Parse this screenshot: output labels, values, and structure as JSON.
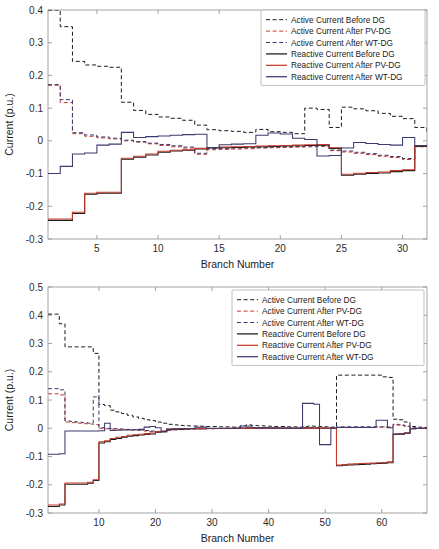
{
  "figure": {
    "title": "",
    "background": "#ffffff"
  },
  "colors": {
    "black": "#1a1a1a",
    "red": "#c0392b",
    "navy": "#3b3b6e",
    "axis": "#9a9a9a",
    "text": "#1a1a1a",
    "legend_border": "#b0b0b0"
  },
  "legend": {
    "position": "top-right",
    "items": [
      {
        "label": "Active Current Before DG",
        "color_key": "black",
        "style": "dashed"
      },
      {
        "label": "Active Current After PV-DG",
        "color_key": "red",
        "style": "dashed"
      },
      {
        "label": "Active Current After WT-DG",
        "color_key": "navy",
        "style": "dashed"
      },
      {
        "label": "Reactive Current Before DG",
        "color_key": "black",
        "style": "solid"
      },
      {
        "label": "Reactive Current After PV-DG",
        "color_key": "red",
        "style": "solid"
      },
      {
        "label": "Reactive Current After WT-DG",
        "color_key": "navy",
        "style": "solid"
      }
    ]
  },
  "chart_data": [
    {
      "id": "top",
      "type": "line",
      "title": "",
      "xlabel": "Branch Number",
      "ylabel": "Current (p.u.)",
      "xlim": [
        1,
        32
      ],
      "ylim": [
        -0.3,
        0.4
      ],
      "xticks": [
        5,
        10,
        15,
        20,
        25,
        30
      ],
      "yticks": [
        -0.3,
        -0.2,
        -0.1,
        0,
        0.1,
        0.2,
        0.3,
        0.4
      ],
      "ytick_labels": [
        "-0.3",
        "-0.2",
        "-0.1",
        "0",
        "0.1",
        "0.2",
        "0.3",
        "0.4"
      ],
      "grid": false,
      "step": "post",
      "x": [
        1,
        2,
        3,
        4,
        5,
        6,
        7,
        8,
        9,
        10,
        11,
        12,
        13,
        14,
        15,
        16,
        17,
        18,
        19,
        20,
        21,
        22,
        23,
        24,
        25,
        26,
        27,
        28,
        29,
        30,
        31,
        32
      ],
      "series": [
        {
          "name": "Active Current Before DG",
          "color_key": "black",
          "style": "dashed",
          "values": [
            0.4,
            0.349,
            0.243,
            0.232,
            0.228,
            0.225,
            0.118,
            0.093,
            0.081,
            0.073,
            0.069,
            0.063,
            0.048,
            0.034,
            0.031,
            0.029,
            0.026,
            0.035,
            0.028,
            0.026,
            0.022,
            0.1,
            0.096,
            0.041,
            0.103,
            0.098,
            0.092,
            0.084,
            0.075,
            0.068,
            0.041,
            0.025
          ]
        },
        {
          "name": "Active Current After PV-DG",
          "color_key": "red",
          "style": "dashed",
          "values": [
            0.17,
            0.117,
            0.022,
            0.014,
            0.009,
            0.006,
            0.0,
            -0.004,
            -0.009,
            -0.014,
            -0.018,
            -0.022,
            -0.041,
            -0.027,
            -0.026,
            -0.025,
            -0.024,
            -0.022,
            -0.021,
            -0.02,
            -0.019,
            -0.018,
            -0.017,
            -0.03,
            -0.034,
            -0.038,
            -0.042,
            -0.047,
            -0.051,
            -0.057,
            -0.018,
            -0.014
          ]
        },
        {
          "name": "Active Current After WT-DG",
          "color_key": "navy",
          "style": "dashed",
          "values": [
            0.172,
            0.126,
            0.025,
            0.018,
            0.012,
            0.008,
            0.002,
            -0.002,
            -0.007,
            -0.011,
            -0.015,
            -0.019,
            -0.038,
            -0.024,
            -0.023,
            -0.022,
            -0.021,
            -0.02,
            -0.019,
            -0.018,
            -0.017,
            -0.016,
            -0.015,
            -0.028,
            -0.031,
            -0.035,
            -0.039,
            -0.044,
            -0.048,
            -0.054,
            -0.016,
            -0.012
          ]
        },
        {
          "name": "Reactive Current Before DG",
          "color_key": "black",
          "style": "solid",
          "values": [
            -0.243,
            -0.243,
            -0.222,
            -0.163,
            -0.16,
            -0.16,
            -0.056,
            -0.05,
            -0.043,
            -0.035,
            -0.031,
            -0.029,
            -0.025,
            -0.022,
            -0.021,
            -0.02,
            -0.019,
            -0.018,
            -0.017,
            -0.016,
            -0.015,
            -0.014,
            -0.013,
            -0.023,
            -0.105,
            -0.102,
            -0.1,
            -0.098,
            -0.094,
            -0.091,
            -0.017,
            -0.014
          ]
        },
        {
          "name": "Reactive Current After PV-DG",
          "color_key": "red",
          "style": "solid",
          "values": [
            -0.239,
            -0.239,
            -0.218,
            -0.16,
            -0.157,
            -0.157,
            -0.053,
            -0.047,
            -0.04,
            -0.032,
            -0.029,
            -0.027,
            -0.023,
            -0.02,
            -0.019,
            -0.018,
            -0.017,
            -0.016,
            -0.015,
            -0.014,
            -0.013,
            -0.012,
            -0.011,
            -0.021,
            -0.102,
            -0.099,
            -0.097,
            -0.095,
            -0.091,
            -0.088,
            -0.015,
            -0.012
          ]
        },
        {
          "name": "Reactive Current After WT-DG",
          "color_key": "navy",
          "style": "solid",
          "values": [
            -0.1,
            -0.078,
            -0.04,
            -0.037,
            -0.013,
            -0.01,
            0.026,
            0.01,
            0.013,
            0.015,
            0.017,
            0.019,
            0.02,
            -0.02,
            -0.012,
            -0.01,
            -0.009,
            0.017,
            0.024,
            0.021,
            0.008,
            0.004,
            -0.046,
            -0.045,
            -0.022,
            -0.005,
            -0.008,
            -0.011,
            -0.013,
            0.01,
            -0.014,
            -0.014
          ]
        }
      ]
    },
    {
      "id": "bottom",
      "type": "line",
      "title": "",
      "xlabel": "Branch Number",
      "ylabel": "Current (p.u.)",
      "xlim": [
        1,
        68
      ],
      "ylim": [
        -0.3,
        0.5
      ],
      "xticks": [
        10,
        20,
        30,
        40,
        50,
        60
      ],
      "yticks": [
        -0.3,
        -0.2,
        -0.1,
        0,
        0.1,
        0.2,
        0.3,
        0.4,
        0.5
      ],
      "ytick_labels": [
        "-0.3",
        "-0.2",
        "-0.1",
        "0",
        "0.1",
        "0.2",
        "0.3",
        "0.4",
        "0.5"
      ],
      "grid": false,
      "step": "post",
      "x": [
        1,
        2,
        3,
        4,
        5,
        6,
        7,
        8,
        9,
        10,
        11,
        12,
        13,
        14,
        15,
        16,
        17,
        18,
        19,
        20,
        21,
        22,
        23,
        24,
        25,
        26,
        27,
        28,
        29,
        30,
        31,
        32,
        33,
        34,
        35,
        36,
        37,
        38,
        39,
        40,
        41,
        42,
        43,
        44,
        45,
        46,
        47,
        48,
        49,
        50,
        51,
        52,
        53,
        54,
        55,
        56,
        57,
        58,
        59,
        60,
        61,
        62,
        63,
        64,
        65,
        66,
        67,
        68
      ],
      "series": [
        {
          "name": "Active Current Before DG",
          "color_key": "black",
          "style": "dashed",
          "values": [
            0.404,
            0.404,
            0.37,
            0.288,
            0.288,
            0.288,
            0.288,
            0.288,
            0.265,
            0.084,
            0.08,
            0.064,
            0.058,
            0.052,
            0.046,
            0.04,
            0.035,
            0.03,
            0.027,
            0.022,
            0.018,
            0.014,
            0.012,
            0.01,
            0.009,
            0.008,
            0.008,
            0.007,
            0.006,
            0.006,
            0.005,
            0.005,
            0.004,
            0.004,
            0.008,
            0.012,
            0.01,
            0.009,
            0.008,
            0.007,
            0.006,
            0.006,
            0.005,
            0.005,
            0.004,
            0.006,
            0.008,
            0.007,
            0.006,
            0.005,
            0.004,
            0.188,
            0.188,
            0.188,
            0.188,
            0.188,
            0.188,
            0.188,
            0.188,
            0.182,
            0.18,
            0.032,
            0.03,
            0.022,
            0.006,
            0.004,
            0.003,
            0.002
          ]
        },
        {
          "name": "Active Current After PV-DG",
          "color_key": "red",
          "style": "dashed",
          "values": [
            0.122,
            0.122,
            0.118,
            0.022,
            0.02,
            0.018,
            0.016,
            0.015,
            0.013,
            0.0,
            -0.002,
            -0.003,
            -0.004,
            -0.005,
            -0.006,
            -0.007,
            -0.008,
            -0.01,
            -0.012,
            -0.013,
            -0.012,
            -0.008,
            -0.006,
            -0.005,
            -0.004,
            -0.003,
            -0.003,
            -0.002,
            -0.002,
            -0.002,
            -0.001,
            -0.001,
            -0.001,
            -0.001,
            0.0,
            0.002,
            0.001,
            0.001,
            0.001,
            0.0,
            0.0,
            0.0,
            0.0,
            0.0,
            0.0,
            0.001,
            0.002,
            0.001,
            0.001,
            0.0,
            0.0,
            0.004,
            0.004,
            0.004,
            0.004,
            0.004,
            0.004,
            0.004,
            0.004,
            0.004,
            0.003,
            0.012,
            0.01,
            0.006,
            0.001,
            0.0,
            0.0,
            0.0
          ]
        },
        {
          "name": "Active Current After WT-DG",
          "color_key": "navy",
          "style": "dashed",
          "values": [
            0.14,
            0.14,
            0.136,
            0.026,
            0.024,
            0.022,
            0.02,
            0.018,
            0.111,
            0.002,
            0.0,
            -0.001,
            -0.002,
            -0.003,
            -0.004,
            -0.005,
            -0.006,
            -0.008,
            -0.01,
            -0.011,
            -0.01,
            -0.006,
            -0.005,
            -0.004,
            -0.003,
            -0.002,
            -0.002,
            -0.002,
            -0.001,
            -0.001,
            -0.001,
            -0.001,
            -0.001,
            0.0,
            0.001,
            0.003,
            0.002,
            0.002,
            0.001,
            0.001,
            0.001,
            0.0,
            0.0,
            0.0,
            0.0,
            0.002,
            0.003,
            0.002,
            0.001,
            0.001,
            0.0,
            0.005,
            0.005,
            0.005,
            0.005,
            0.005,
            0.005,
            0.005,
            0.005,
            0.005,
            0.004,
            0.014,
            0.012,
            0.008,
            0.002,
            0.001,
            0.0,
            0.0
          ]
        },
        {
          "name": "Reactive Current Before DG",
          "color_key": "black",
          "style": "solid",
          "values": [
            -0.277,
            -0.277,
            -0.272,
            -0.198,
            -0.198,
            -0.198,
            -0.198,
            -0.195,
            -0.185,
            -0.052,
            -0.048,
            -0.04,
            -0.036,
            -0.032,
            -0.028,
            -0.026,
            -0.024,
            -0.022,
            -0.02,
            -0.014,
            -0.012,
            -0.004,
            -0.003,
            -0.003,
            -0.002,
            -0.002,
            -0.002,
            -0.002,
            -0.001,
            -0.001,
            -0.001,
            -0.001,
            -0.001,
            0.0,
            0.0,
            0.0,
            0.0,
            0.0,
            0.0,
            0.0,
            0.0,
            0.0,
            0.0,
            0.0,
            0.0,
            0.0,
            0.0,
            0.0,
            0.0,
            0.0,
            0.0,
            -0.133,
            -0.131,
            -0.13,
            -0.129,
            -0.128,
            -0.127,
            -0.126,
            -0.125,
            -0.124,
            -0.122,
            -0.022,
            -0.021,
            -0.018,
            -0.002,
            -0.001,
            -0.001,
            0.0
          ]
        },
        {
          "name": "Reactive Current After PV-DG",
          "color_key": "red",
          "style": "solid",
          "values": [
            -0.272,
            -0.272,
            -0.268,
            -0.194,
            -0.194,
            -0.194,
            -0.194,
            -0.191,
            -0.182,
            -0.048,
            -0.044,
            -0.036,
            -0.032,
            -0.029,
            -0.025,
            -0.023,
            -0.021,
            -0.019,
            -0.017,
            -0.012,
            -0.01,
            -0.003,
            -0.002,
            -0.002,
            -0.002,
            -0.001,
            -0.001,
            -0.001,
            -0.001,
            -0.001,
            -0.001,
            0.0,
            0.0,
            0.0,
            0.0,
            0.0,
            0.0,
            0.0,
            0.0,
            0.0,
            0.0,
            0.0,
            0.0,
            0.0,
            0.0,
            0.0,
            0.0,
            0.0,
            0.0,
            0.0,
            0.0,
            -0.13,
            -0.128,
            -0.127,
            -0.126,
            -0.125,
            -0.124,
            -0.123,
            -0.122,
            -0.121,
            -0.119,
            -0.02,
            -0.019,
            -0.016,
            -0.001,
            -0.001,
            0.0,
            0.0
          ]
        },
        {
          "name": "Reactive Current After WT-DG",
          "color_key": "navy",
          "style": "solid",
          "values": [
            -0.092,
            -0.092,
            -0.09,
            -0.01,
            -0.01,
            -0.01,
            -0.01,
            -0.01,
            -0.01,
            -0.009,
            0.018,
            -0.008,
            -0.007,
            -0.006,
            -0.006,
            -0.005,
            -0.004,
            0.004,
            0.006,
            0.002,
            -0.012,
            -0.004,
            -0.003,
            -0.002,
            -0.002,
            -0.001,
            0.004,
            0.004,
            0.0,
            0.0,
            0.0,
            0.0,
            0.0,
            0.0,
            0.008,
            0.008,
            0.002,
            0.002,
            0.002,
            0.001,
            0.001,
            0.001,
            0.001,
            0.0,
            0.0,
            0.088,
            0.088,
            0.085,
            -0.058,
            -0.058,
            0.0,
            0.003,
            0.003,
            0.003,
            0.003,
            0.003,
            0.003,
            0.003,
            0.028,
            0.028,
            0.002,
            -0.02,
            -0.02,
            -0.018,
            -0.002,
            -0.001,
            0.0,
            0.0
          ]
        }
      ]
    }
  ]
}
